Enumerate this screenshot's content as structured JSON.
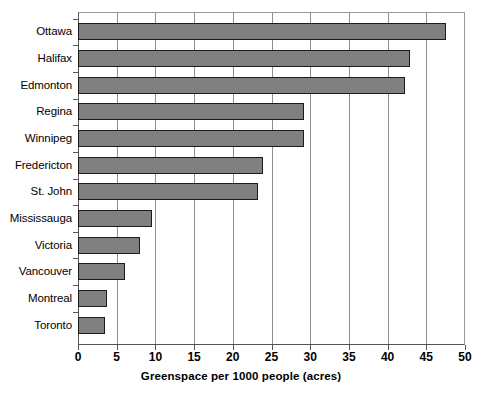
{
  "chart_data": {
    "type": "bar",
    "orientation": "horizontal",
    "title": "",
    "xlabel": "Greenspace per 1000 people (acres)",
    "ylabel": "",
    "xlim": [
      0,
      50
    ],
    "xticks": [
      0,
      5,
      10,
      15,
      20,
      25,
      30,
      35,
      40,
      45,
      50
    ],
    "xtick_labels": [
      "0",
      "5",
      "10",
      "15",
      "20",
      "25",
      "30",
      "35",
      "40",
      "45",
      "50"
    ],
    "grid": "vertical",
    "legend": "none",
    "categories": [
      "Ottawa",
      "Halifax",
      "Edmonton",
      "Regina",
      "Winnipeg",
      "Fredericton",
      "St. John",
      "Mississauga",
      "Victoria",
      "Vancouver",
      "Montreal",
      "Toronto"
    ],
    "values": [
      47.5,
      42.9,
      42.2,
      29.2,
      29.2,
      23.9,
      23.2,
      9.6,
      8.0,
      6.1,
      3.8,
      3.5
    ],
    "bar_color": "#808080",
    "bar_border_color": "#1c1c1c",
    "grid_color": "#8f8f8f",
    "axis_color": "#555555",
    "background_color": "#ffffff"
  }
}
